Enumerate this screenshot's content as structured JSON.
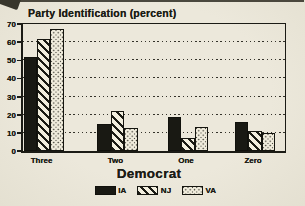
{
  "colors": {
    "background": "#ece8db",
    "ink": "#1c1c16",
    "bar_black": "#191913",
    "pattern_background": "#f2eede"
  },
  "chart_data": {
    "type": "bar",
    "title": "Party Identification (percent)",
    "xlabel": "Democrat",
    "ylabel": "",
    "categories": [
      "Three",
      "Two",
      "One",
      "Zero"
    ],
    "series": [
      {
        "name": "IA",
        "fill": "solid",
        "values": [
          52,
          15,
          19,
          16
        ]
      },
      {
        "name": "NJ",
        "fill": "diagonal-hatch",
        "values": [
          62,
          22,
          7,
          11
        ]
      },
      {
        "name": "VA",
        "fill": "dots",
        "values": [
          67,
          12.5,
          13,
          10
        ]
      }
    ],
    "ylim": [
      0,
      70
    ],
    "y_ticks": [
      0,
      10,
      20,
      30,
      40,
      50,
      60,
      70
    ],
    "grid": "horizontal-dotted",
    "legend_position": "bottom",
    "legend": [
      "IA",
      "NJ",
      "VA"
    ]
  }
}
